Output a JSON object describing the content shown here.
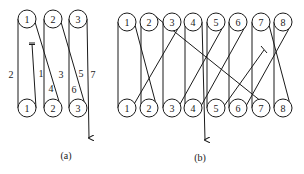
{
  "diagram_a": {
    "caption": "(a)",
    "top_rollers": [
      "1",
      "2",
      "3"
    ],
    "bottom_rollers": [
      "1",
      "2",
      "3"
    ],
    "path_labels": [
      "1",
      "2",
      "3",
      "4",
      "5",
      "6",
      "7"
    ]
  },
  "diagram_b": {
    "caption": "(b)",
    "top_rollers": [
      "1",
      "2",
      "3",
      "4",
      "5",
      "6",
      "7",
      "8"
    ],
    "bottom_rollers": [
      "1",
      "2",
      "3",
      "4",
      "5",
      "6",
      "7",
      "8"
    ]
  },
  "colors": {
    "line": "#1a1a1a",
    "background": "#ffffff"
  }
}
